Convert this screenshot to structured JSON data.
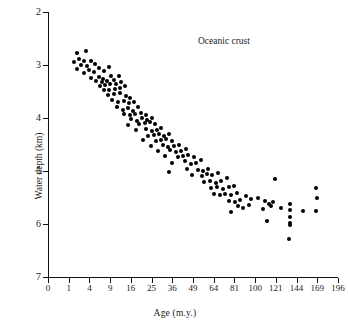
{
  "chart_data": {
    "type": "scatter",
    "title": "",
    "annotation": "Oceanic crust",
    "xlabel": "Age (m.y.)",
    "ylabel": "Water depth (km)",
    "xscale": "sqrt",
    "xlim": [
      0,
      196
    ],
    "ylim": [
      2,
      7
    ],
    "y_inverted": true,
    "grid": false,
    "legend": null,
    "xticks": [
      0,
      1,
      4,
      9,
      16,
      25,
      36,
      49,
      64,
      81,
      100,
      121,
      144,
      169,
      196
    ],
    "xticklabels": [
      "0",
      "1",
      "4",
      "9",
      "16",
      "25",
      "36",
      "49",
      "64",
      "81",
      "100",
      "121",
      "144",
      "169",
      "196"
    ],
    "yticks": [
      2,
      3,
      4,
      5,
      6,
      7
    ],
    "yticklabels": [
      "2",
      "3",
      "4",
      "5",
      "6",
      "7"
    ],
    "series": [
      {
        "name": "Oceanic crust depth vs age",
        "marker": "circle",
        "color": "#000000",
        "points": [
          [
            2.0,
            2.77
          ],
          [
            3.4,
            2.73
          ],
          [
            2.3,
            2.88
          ],
          [
            3.0,
            2.93
          ],
          [
            1.6,
            2.95
          ],
          [
            4.4,
            2.92
          ],
          [
            2.6,
            3.0
          ],
          [
            3.6,
            3.02
          ],
          [
            5.2,
            2.98
          ],
          [
            2.0,
            3.08
          ],
          [
            4.0,
            3.1
          ],
          [
            6.1,
            3.05
          ],
          [
            3.0,
            3.16
          ],
          [
            5.0,
            3.14
          ],
          [
            7.3,
            3.12
          ],
          [
            8.6,
            3.04
          ],
          [
            4.3,
            3.24
          ],
          [
            6.0,
            3.22
          ],
          [
            7.0,
            3.26
          ],
          [
            9.2,
            3.2
          ],
          [
            5.3,
            3.31
          ],
          [
            6.8,
            3.33
          ],
          [
            8.2,
            3.3
          ],
          [
            10.0,
            3.28
          ],
          [
            11.6,
            3.2
          ],
          [
            6.2,
            3.4
          ],
          [
            7.6,
            3.38
          ],
          [
            9.0,
            3.36
          ],
          [
            10.8,
            3.35
          ],
          [
            12.5,
            3.33
          ],
          [
            7.2,
            3.48
          ],
          [
            8.8,
            3.47
          ],
          [
            10.4,
            3.45
          ],
          [
            12.0,
            3.43
          ],
          [
            13.8,
            3.4
          ],
          [
            8.4,
            3.57
          ],
          [
            10.2,
            3.55
          ],
          [
            12.2,
            3.53
          ],
          [
            14.0,
            3.58
          ],
          [
            15.8,
            3.62
          ],
          [
            9.6,
            3.66
          ],
          [
            11.4,
            3.7
          ],
          [
            13.4,
            3.68
          ],
          [
            15.2,
            3.72
          ],
          [
            17.2,
            3.7
          ],
          [
            11.0,
            3.8
          ],
          [
            13.0,
            3.84
          ],
          [
            14.8,
            3.82
          ],
          [
            16.8,
            3.86
          ],
          [
            18.8,
            3.8
          ],
          [
            13.6,
            3.92
          ],
          [
            15.6,
            3.95
          ],
          [
            17.8,
            3.93
          ],
          [
            20.0,
            3.9
          ],
          [
            22.2,
            3.95
          ],
          [
            16.2,
            4.02
          ],
          [
            18.4,
            4.05
          ],
          [
            20.6,
            4.0
          ],
          [
            23.0,
            4.03
          ],
          [
            25.4,
            4.0
          ],
          [
            15.0,
            4.14
          ],
          [
            19.4,
            4.12
          ],
          [
            21.8,
            4.1
          ],
          [
            24.2,
            4.08
          ],
          [
            26.6,
            4.12
          ],
          [
            18.0,
            4.22
          ],
          [
            22.6,
            4.2
          ],
          [
            25.0,
            4.24
          ],
          [
            27.6,
            4.22
          ],
          [
            30.0,
            4.18
          ],
          [
            23.4,
            4.34
          ],
          [
            26.0,
            4.32
          ],
          [
            28.6,
            4.3
          ],
          [
            31.4,
            4.34
          ],
          [
            34.0,
            4.3
          ],
          [
            21.0,
            4.42
          ],
          [
            27.0,
            4.44
          ],
          [
            29.8,
            4.42
          ],
          [
            32.6,
            4.4
          ],
          [
            35.6,
            4.44
          ],
          [
            24.6,
            4.52
          ],
          [
            30.8,
            4.5
          ],
          [
            33.8,
            4.54
          ],
          [
            36.8,
            4.52
          ],
          [
            40.0,
            4.5
          ],
          [
            28.2,
            4.62
          ],
          [
            34.8,
            4.6
          ],
          [
            38.0,
            4.64
          ],
          [
            41.4,
            4.62
          ],
          [
            44.6,
            4.58
          ],
          [
            32.0,
            4.72
          ],
          [
            39.2,
            4.74
          ],
          [
            42.6,
            4.72
          ],
          [
            46.0,
            4.7
          ],
          [
            49.6,
            4.74
          ],
          [
            36.0,
            4.84
          ],
          [
            43.8,
            4.82
          ],
          [
            47.4,
            4.86
          ],
          [
            51.0,
            4.84
          ],
          [
            54.8,
            4.8
          ],
          [
            34.0,
            5.02
          ],
          [
            45.0,
            4.96
          ],
          [
            52.4,
            4.98
          ],
          [
            56.2,
            5.0
          ],
          [
            60.0,
            4.96
          ],
          [
            48.0,
            5.08
          ],
          [
            55.0,
            5.1
          ],
          [
            58.6,
            5.06
          ],
          [
            63.0,
            5.08
          ],
          [
            67.2,
            5.04
          ],
          [
            57.0,
            5.2
          ],
          [
            61.4,
            5.18
          ],
          [
            65.6,
            5.22
          ],
          [
            70.0,
            5.18
          ],
          [
            74.4,
            5.14
          ],
          [
            62.0,
            5.32
          ],
          [
            66.6,
            5.3
          ],
          [
            71.2,
            5.34
          ],
          [
            76.0,
            5.3
          ],
          [
            80.8,
            5.28
          ],
          [
            64.0,
            5.44
          ],
          [
            68.6,
            5.46
          ],
          [
            73.4,
            5.44
          ],
          [
            78.2,
            5.46
          ],
          [
            83.2,
            5.42
          ],
          [
            76.6,
            5.56
          ],
          [
            81.2,
            5.58
          ],
          [
            86.0,
            5.54
          ],
          [
            91.0,
            5.48
          ],
          [
            96.0,
            5.52
          ],
          [
            84.0,
            5.66
          ],
          [
            89.0,
            5.7
          ],
          [
            94.0,
            5.64
          ],
          [
            78.0,
            5.78
          ],
          [
            103.0,
            5.5
          ],
          [
            110.0,
            5.56
          ],
          [
            114.0,
            5.62
          ],
          [
            118.0,
            5.58
          ],
          [
            108.0,
            5.72
          ],
          [
            116.0,
            5.66
          ],
          [
            112.0,
            5.94
          ],
          [
            120.0,
            5.16
          ],
          [
            136.0,
            5.62
          ],
          [
            136.0,
            5.74
          ],
          [
            136.5,
            5.86
          ],
          [
            136.0,
            5.98
          ],
          [
            136.5,
            6.02
          ],
          [
            135.0,
            6.28
          ],
          [
            152.0,
            5.76
          ],
          [
            168.0,
            5.32
          ],
          [
            168.5,
            5.5
          ],
          [
            167.0,
            5.76
          ],
          [
            126.0,
            5.7
          ]
        ]
      }
    ]
  }
}
